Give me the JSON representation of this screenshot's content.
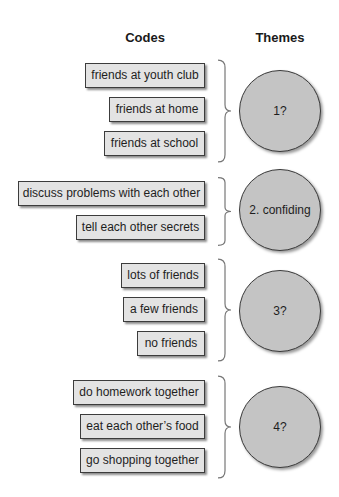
{
  "headers": {
    "codes": "Codes",
    "themes": "Themes"
  },
  "colors": {
    "box_fill": "#e3e3e3",
    "circle_fill": "#c4c4c4",
    "border": "#3c3c3c"
  },
  "groups": [
    {
      "codes": [
        "friends at youth club",
        "friends at home",
        "friends at school"
      ],
      "theme": "1?"
    },
    {
      "codes": [
        "discuss problems with each other",
        "tell each other secrets"
      ],
      "theme": "2. confiding"
    },
    {
      "codes": [
        "lots of friends",
        "a few friends",
        "no friends"
      ],
      "theme": "3?"
    },
    {
      "codes": [
        "do homework together",
        "eat each other’s food",
        "go shopping together"
      ],
      "theme": "4?"
    }
  ]
}
